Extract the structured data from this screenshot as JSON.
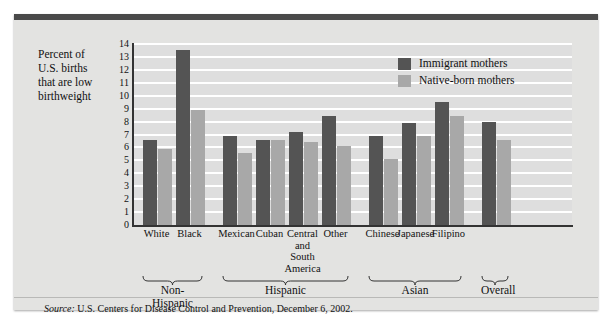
{
  "chart_data": {
    "type": "bar",
    "title": "",
    "ylabel": "Percent of U.S. births that are low birthweight",
    "xlabel": "",
    "ylim": [
      0,
      14
    ],
    "yticks": [
      14,
      13,
      12,
      11,
      10,
      9,
      8,
      7,
      6,
      5,
      4,
      3,
      2,
      1,
      0
    ],
    "grid": true,
    "legend_position": "top-right",
    "categories": [
      "White",
      "Black",
      "Mexican",
      "Cuban",
      "Central and South America",
      "Other",
      "Chinese",
      "Japanese",
      "Filipino",
      "Overall"
    ],
    "series": [
      {
        "name": "Immigrant mothers",
        "color": "#545454",
        "values": [
          6.6,
          13.5,
          6.9,
          6.6,
          7.2,
          8.4,
          6.9,
          7.9,
          9.5,
          8.0
        ]
      },
      {
        "name": "Native-born mothers",
        "color": "#a8a8a8",
        "values": [
          5.9,
          8.9,
          5.6,
          6.6,
          6.4,
          6.1,
          5.1,
          6.9,
          8.4,
          6.6
        ]
      }
    ],
    "category_groups": [
      {
        "label": "Non-Hispanic",
        "categories": [
          "White",
          "Black"
        ]
      },
      {
        "label": "Hispanic",
        "categories": [
          "Mexican",
          "Cuban",
          "Central and South America",
          "Other"
        ]
      },
      {
        "label": "Asian",
        "categories": [
          "Chinese",
          "Japanese",
          "Filipino"
        ]
      },
      {
        "label": "Overall",
        "categories": [
          "Overall"
        ]
      }
    ],
    "source": "U.S. Centers for Disease Control and Prevention, December 6, 2002."
  },
  "axis": {
    "y_label_line1": "Percent of",
    "y_label_line2": "U.S. births",
    "y_label_line3": "that are low",
    "y_label_line4": "birthweight",
    "ticks": [
      "14",
      "13",
      "12",
      "11",
      "10",
      "9",
      "8",
      "7",
      "6",
      "5",
      "4",
      "3",
      "2",
      "1",
      "0"
    ]
  },
  "legend": {
    "items": [
      {
        "label": "Immigrant mothers",
        "swatch": "#545454"
      },
      {
        "label": "Native-born mothers",
        "swatch": "#a8a8a8"
      }
    ]
  },
  "categories": [
    {
      "label": "White",
      "lines": [
        "White"
      ]
    },
    {
      "label": "Black",
      "lines": [
        "Black"
      ]
    },
    {
      "label": "Mexican",
      "lines": [
        "Mexican"
      ]
    },
    {
      "label": "Cuban",
      "lines": [
        "Cuban"
      ]
    },
    {
      "label": "Central and South America",
      "lines": [
        "Central",
        "and",
        "South",
        "America"
      ]
    },
    {
      "label": "Other",
      "lines": [
        "Other"
      ]
    },
    {
      "label": "Chinese",
      "lines": [
        "Chinese"
      ]
    },
    {
      "label": "Japanese",
      "lines": [
        "Japanese"
      ]
    },
    {
      "label": "Filipino",
      "lines": [
        "Filipino"
      ]
    },
    {
      "label": "Overall",
      "lines": [
        ""
      ]
    }
  ],
  "groups": [
    {
      "label": "Non-Hispanic"
    },
    {
      "label": "Hispanic"
    },
    {
      "label": "Asian"
    },
    {
      "label": "Overall"
    }
  ],
  "footer": {
    "source_prefix": "Source:",
    "source_text": "U.S. Centers for Disease Control and Prevention, December 6, 2002."
  },
  "colors": {
    "card_background": "#e3e3e1",
    "plot_background": "#dedede",
    "topbar": "#4a4a4a",
    "immigrant": "#545454",
    "native": "#a8a8a8",
    "gridline": "#ffffff",
    "axis": "#333333"
  }
}
